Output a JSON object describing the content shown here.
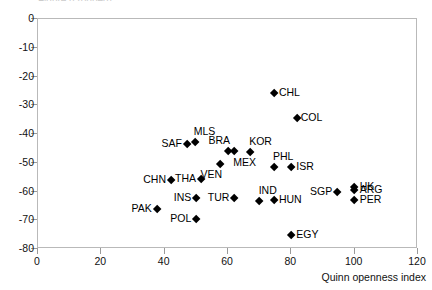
{
  "top_title_sliver": "Figure (cropped)",
  "chart_data": {
    "type": "scatter",
    "title": "",
    "xlabel": "Quinn openness index",
    "ylabel": "",
    "xlim": [
      0,
      120
    ],
    "ylim": [
      -80,
      0
    ],
    "xticks": [
      0,
      20,
      40,
      60,
      80,
      100,
      120
    ],
    "yticks": [
      0,
      -10,
      -20,
      -30,
      -40,
      -50,
      -60,
      -70,
      -80
    ],
    "xtick_labels": [
      "0",
      "20",
      "40",
      "60",
      "80",
      "100",
      "120"
    ],
    "ytick_labels": [
      "0",
      "-10",
      "-20",
      "-30",
      "-40",
      "-50",
      "-60",
      "-70",
      "-80"
    ],
    "grid": false,
    "legend": "none",
    "marker": "diamond",
    "marker_color": "#000000",
    "points": [
      {
        "label": "CHL",
        "x": 74.5,
        "y": -25.7,
        "label_pos": "right"
      },
      {
        "label": "COL",
        "x": 82.0,
        "y": -34.4,
        "label_pos": "right-tight"
      },
      {
        "label": "MLS",
        "x": 49.5,
        "y": -42.7,
        "label_pos": "above"
      },
      {
        "label": "SAF",
        "x": 47.0,
        "y": -43.5,
        "label_pos": "left"
      },
      {
        "label": "BRA",
        "x": 60.0,
        "y": -45.9,
        "label_pos": "above-left"
      },
      {
        "label": "MEX",
        "x": 62.0,
        "y": -46.1,
        "label_pos": "below"
      },
      {
        "label": "KOR",
        "x": 67.0,
        "y": -46.3,
        "label_pos": "above"
      },
      {
        "label": "VEN",
        "x": 57.5,
        "y": -50.4,
        "label_pos": "below-left"
      },
      {
        "label": "PHL",
        "x": 74.5,
        "y": -51.6,
        "label_pos": "above"
      },
      {
        "label": "ISR",
        "x": 80.0,
        "y": -51.6,
        "label_pos": "right"
      },
      {
        "label": "CHN",
        "x": 42.0,
        "y": -56.1,
        "label_pos": "left"
      },
      {
        "label": "THA",
        "x": 51.5,
        "y": -55.8,
        "label_pos": "left"
      },
      {
        "label": "HK",
        "x": 100.0,
        "y": -58.4,
        "label_pos": "right"
      },
      {
        "label": "ARG",
        "x": 100.0,
        "y": -59.6,
        "label_pos": "right"
      },
      {
        "label": "SGP",
        "x": 94.5,
        "y": -60.2,
        "label_pos": "left"
      },
      {
        "label": "IND",
        "x": 70.0,
        "y": -63.4,
        "label_pos": "above"
      },
      {
        "label": "INS",
        "x": 50.0,
        "y": -62.3,
        "label_pos": "left"
      },
      {
        "label": "TUR",
        "x": 62.0,
        "y": -62.3,
        "label_pos": "left"
      },
      {
        "label": "HUN",
        "x": 74.5,
        "y": -62.9,
        "label_pos": "right"
      },
      {
        "label": "PER",
        "x": 100.0,
        "y": -62.9,
        "label_pos": "right"
      },
      {
        "label": "PAK",
        "x": 37.5,
        "y": -66.0,
        "label_pos": "left"
      },
      {
        "label": "POL",
        "x": 50.0,
        "y": -69.5,
        "label_pos": "left"
      },
      {
        "label": "EGY",
        "x": 80.0,
        "y": -75.2,
        "label_pos": "right"
      }
    ]
  }
}
